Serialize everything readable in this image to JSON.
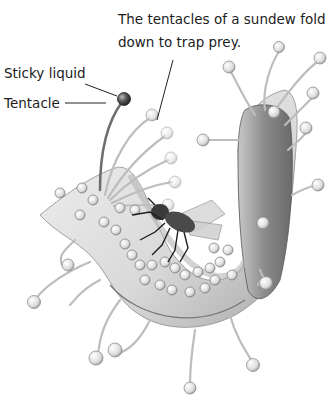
{
  "diagram": {
    "caption": "The tentacles of a sundew fold down to trap prey.",
    "labels": [
      {
        "id": "sticky-liquid",
        "text": "Sticky liquid"
      },
      {
        "id": "tentacle",
        "text": "Tentacle"
      }
    ],
    "parts": [
      "leaf-blade",
      "tentacles",
      "sticky-liquid-droplets",
      "trapped-fly"
    ],
    "colors": {
      "background": "#ffffff",
      "text": "#1c1c1c",
      "leaf_light": "#e6e6e6",
      "leaf_shade": "#9a9a9a",
      "leaf_dark": "#6e6e6e",
      "leader_line": "#222222"
    }
  }
}
